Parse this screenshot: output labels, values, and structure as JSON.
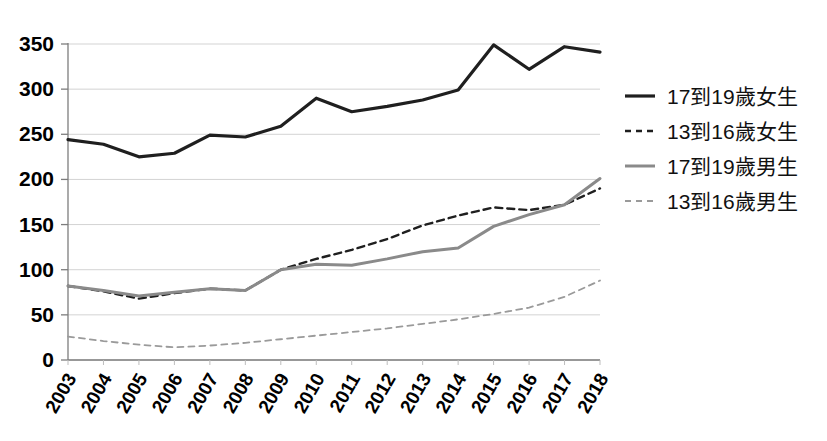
{
  "chart_data": {
    "type": "line",
    "title": "",
    "xlabel": "",
    "ylabel": "",
    "categories": [
      "2003",
      "2004",
      "2005",
      "2006",
      "2007",
      "2008",
      "2009",
      "2010",
      "2011",
      "2012",
      "2013",
      "2014",
      "2015",
      "2016",
      "2017",
      "2018"
    ],
    "x": [
      2003,
      2004,
      2005,
      2006,
      2007,
      2008,
      2009,
      2010,
      2011,
      2012,
      2013,
      2014,
      2015,
      2016,
      2017,
      2018
    ],
    "ylim": [
      0,
      350
    ],
    "xlim": [
      2003,
      2018
    ],
    "yticks": [
      0,
      50,
      100,
      150,
      200,
      250,
      300,
      350
    ],
    "ytick_labels": [
      "0",
      "50",
      "100",
      "150",
      "200",
      "250",
      "300",
      "350"
    ],
    "grid": "horizontal",
    "legend_position": "right",
    "series": [
      {
        "name": "17到19歲女生",
        "style": "solid",
        "color": "#1f1f1f",
        "width": 3.2,
        "values": [
          244,
          239,
          225,
          229,
          249,
          247,
          259,
          290,
          275,
          281,
          288,
          299,
          349,
          322,
          347,
          341
        ]
      },
      {
        "name": "13到16歲女生",
        "style": "dashed",
        "color": "#1f1f1f",
        "width": 2.4,
        "values": [
          82,
          76,
          68,
          74,
          79,
          77,
          100,
          112,
          122,
          134,
          149,
          160,
          169,
          166,
          172,
          190
        ]
      },
      {
        "name": "17到19歲男生",
        "style": "solid",
        "color": "#8a8a8a",
        "width": 3.0,
        "values": [
          82,
          77,
          71,
          75,
          79,
          77,
          100,
          106,
          105,
          112,
          120,
          124,
          148,
          161,
          172,
          201
        ]
      },
      {
        "name": "13到16歲男生",
        "style": "dashed",
        "color": "#9a9a9a",
        "width": 1.8,
        "values": [
          26,
          21,
          17,
          14,
          16,
          19,
          23,
          27,
          31,
          35,
          40,
          45,
          51,
          58,
          70,
          88
        ]
      }
    ]
  },
  "legend": {
    "items": [
      {
        "label": "17到19歲女生"
      },
      {
        "label": "13到16歲女生"
      },
      {
        "label": "17到19歲男生"
      },
      {
        "label": "13到16歲男生"
      }
    ]
  }
}
